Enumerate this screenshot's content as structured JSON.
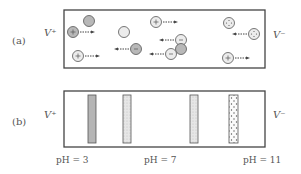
{
  "panel_a": {
    "label": "(a)",
    "left_electrode": "V⁺",
    "right_electrode": "V⁻",
    "particles": [
      {
        "charge": "neutral",
        "style": "dark",
        "arrow": "none"
      },
      {
        "charge": "+",
        "style": "dark",
        "arrow": "right"
      },
      {
        "charge": "+",
        "style": "light",
        "arrow": "right"
      },
      {
        "charge": "neutral",
        "style": "light",
        "arrow": "none"
      },
      {
        "charge": "-",
        "style": "dark",
        "arrow": "left"
      },
      {
        "charge": "+",
        "style": "light",
        "arrow": "right"
      },
      {
        "charge": "-",
        "style": "light",
        "arrow": "left"
      },
      {
        "charge": "neutral",
        "style": "dark",
        "arrow": "none"
      },
      {
        "charge": "-",
        "style": "light",
        "arrow": "left"
      },
      {
        "charge": "dotted",
        "style": "light",
        "arrow": "none"
      },
      {
        "charge": "dotted",
        "style": "light",
        "arrow": "left"
      },
      {
        "charge": "+",
        "style": "light",
        "arrow": "right"
      }
    ]
  },
  "panel_b": {
    "label": "(b)",
    "left_electrode": "V⁺",
    "right_electrode": "V⁻",
    "bands": [
      {
        "name": "band-1",
        "pattern": "dark-gray"
      },
      {
        "name": "band-2",
        "pattern": "light-hatch"
      },
      {
        "name": "band-3",
        "pattern": "light-hatch"
      },
      {
        "name": "band-4",
        "pattern": "dotted"
      }
    ],
    "ph_labels": [
      "pH = 3",
      "pH = 7",
      "pH = 11"
    ]
  }
}
